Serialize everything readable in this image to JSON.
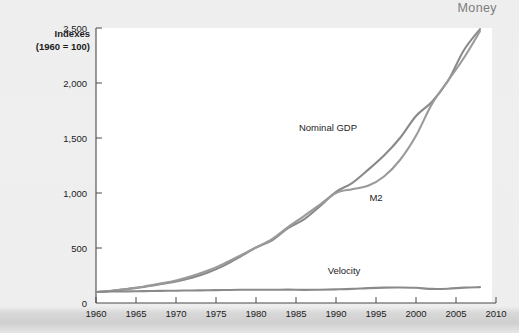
{
  "header": {
    "title": "Money"
  },
  "chart_data": {
    "type": "line",
    "title": "Money",
    "xlabel": "",
    "ylabel": "Indexes\n(1960 = 100)",
    "ylabel_line1": "Indexes",
    "ylabel_line2": "(1960 = 100)",
    "xlim": [
      1960,
      2010
    ],
    "ylim": [
      0,
      2500
    ],
    "grid": false,
    "legend": "inline-annotations",
    "y_ticks": [
      0,
      500,
      1000,
      1500,
      2000,
      2500
    ],
    "y_tick_labels": [
      "0",
      "500",
      "1,000",
      "1,500",
      "2,000",
      "2,500"
    ],
    "x_ticks": [
      1960,
      1965,
      1970,
      1975,
      1980,
      1985,
      1990,
      1995,
      2000,
      2005,
      2010
    ],
    "x_tick_labels": [
      "1960",
      "1965",
      "1970",
      "1975",
      "1980",
      "1985",
      "1990",
      "1995",
      "2000",
      "2005",
      "2010"
    ],
    "x": [
      1960,
      1962,
      1964,
      1966,
      1968,
      1970,
      1972,
      1974,
      1976,
      1978,
      1980,
      1982,
      1984,
      1986,
      1988,
      1990,
      1992,
      1994,
      1996,
      1998,
      2000,
      2002,
      2004,
      2006,
      2008
    ],
    "series": [
      {
        "name": "Nominal GDP",
        "color": "#8a8a8a",
        "label_x": 1989,
        "label_y": 1560,
        "values": [
          100,
          112,
          128,
          146,
          170,
          196,
          230,
          278,
          340,
          420,
          505,
          570,
          680,
          760,
          880,
          1010,
          1090,
          1210,
          1340,
          1500,
          1700,
          1830,
          2020,
          2300,
          2490
        ]
      },
      {
        "name": "M2",
        "color": "#9a9a9a",
        "label_x": 1995,
        "label_y": 930,
        "values": [
          100,
          112,
          130,
          150,
          176,
          205,
          245,
          295,
          358,
          430,
          505,
          580,
          690,
          790,
          895,
          1000,
          1035,
          1065,
          1150,
          1300,
          1520,
          1810,
          2020,
          2230,
          2470
        ]
      },
      {
        "name": "Velocity",
        "color": "#8a8a8a",
        "label_x": 1991,
        "label_y": 265,
        "values": [
          100,
          104,
          106,
          108,
          110,
          112,
          114,
          116,
          118,
          120,
          121,
          120,
          122,
          119,
          121,
          124,
          128,
          135,
          140,
          141,
          138,
          128,
          130,
          140,
          144
        ]
      }
    ]
  }
}
